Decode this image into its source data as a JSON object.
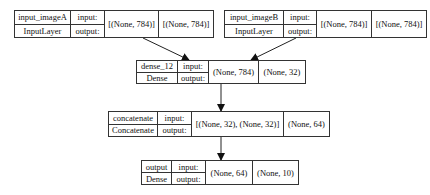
{
  "nodes": [
    {
      "id": "input_imageA",
      "name": "input_imageA",
      "type": "InputLayer",
      "in_label": "input:",
      "out_label": "output:",
      "input_shape": "[(None, 784)]",
      "output_shape": "[(None, 784)]"
    },
    {
      "id": "input_imageB",
      "name": "input_imageB",
      "type": "InputLayer",
      "in_label": "input:",
      "out_label": "output:",
      "input_shape": "[(None, 784)]",
      "output_shape": "[(None, 784)]"
    },
    {
      "id": "dense_12",
      "name": "dense_12",
      "type": "Dense",
      "in_label": "input:",
      "out_label": "output:",
      "input_shape": "(None, 784)",
      "output_shape": "(None, 32)"
    },
    {
      "id": "concatenate",
      "name": "concatenate",
      "type": "Concatenate",
      "in_label": "input:",
      "out_label": "output:",
      "input_shape": "[(None, 32), (None, 32)]",
      "output_shape": "(None, 64)"
    },
    {
      "id": "output",
      "name": "output",
      "type": "Dense",
      "in_label": "input:",
      "out_label": "output:",
      "input_shape": "(None, 64)",
      "output_shape": "(None, 10)"
    }
  ],
  "edges": [
    {
      "from": "input_imageA",
      "to": "dense_12"
    },
    {
      "from": "input_imageB",
      "to": "dense_12"
    },
    {
      "from": "dense_12",
      "to": "concatenate"
    },
    {
      "from": "concatenate",
      "to": "output"
    }
  ]
}
